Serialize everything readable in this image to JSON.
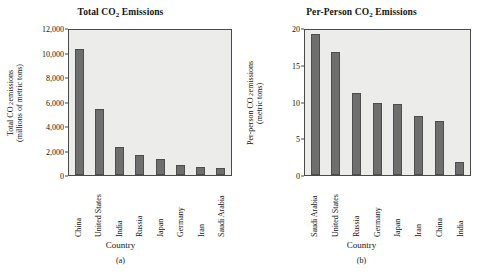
{
  "figure": {
    "panels": [
      {
        "key": "a",
        "caption": "(a)",
        "title_prefix": "Total CO",
        "title_sub": "2",
        "title_suffix": " Emissions",
        "title_plain": "Total CO2 Emissions",
        "xaxis_title": "Country",
        "ylabel_line1_prefix": "Total CO",
        "ylabel_line1_sub": "2",
        "ylabel_line1_suffix": " emissions",
        "ylabel_line2": "(millions of metric tons)",
        "yticks": [
          "12,000",
          "10,000",
          "8,000",
          "6,000",
          "4,000",
          "2,000",
          "0"
        ]
      },
      {
        "key": "b",
        "caption": "(b)",
        "title_prefix": "Per-Person CO",
        "title_sub": "2",
        "title_suffix": " Emissions",
        "title_plain": "Per-Person CO2 Emissions",
        "xaxis_title": "Country",
        "ylabel_line1_prefix": "Per-person CO",
        "ylabel_line1_sub": "2",
        "ylabel_line1_suffix": " emissions",
        "ylabel_line2": "(metric tons)",
        "yticks": [
          "20",
          "15",
          "10",
          "5",
          "0"
        ]
      }
    ]
  },
  "chart_data": [
    {
      "type": "bar",
      "panel": "a",
      "title": "Total CO2 Emissions",
      "xlabel": "Country",
      "ylabel": "Total CO2 emissions (millions of metric tons)",
      "ylim": [
        0,
        12000
      ],
      "ytick_values": [
        0,
        2000,
        4000,
        6000,
        8000,
        10000,
        12000
      ],
      "grid": false,
      "legend": "none",
      "bar_color": "#6e6e6e",
      "plot_background": "#ececeb",
      "categories": [
        "China",
        "United States",
        "India",
        "Russia",
        "Japan",
        "Germany",
        "Iran",
        "Saudi Arabia"
      ],
      "values": [
        10400,
        5450,
        2300,
        1650,
        1300,
        800,
        680,
        620
      ]
    },
    {
      "type": "bar",
      "panel": "b",
      "title": "Per-Person CO2 Emissions",
      "xlabel": "Country",
      "ylabel": "Per-person CO2 emissions (metric tons)",
      "ylim": [
        0,
        20
      ],
      "ytick_values": [
        0,
        5,
        10,
        15,
        20
      ],
      "grid": false,
      "legend": "none",
      "bar_color": "#6e6e6e",
      "plot_background": "#ececeb",
      "categories": [
        "Saudi Arabia",
        "United States",
        "Russia",
        "Germany",
        "Japan",
        "Iran",
        "China",
        "India"
      ],
      "values": [
        19.5,
        17.0,
        11.3,
        10.0,
        9.8,
        8.2,
        7.5,
        1.8
      ]
    }
  ]
}
